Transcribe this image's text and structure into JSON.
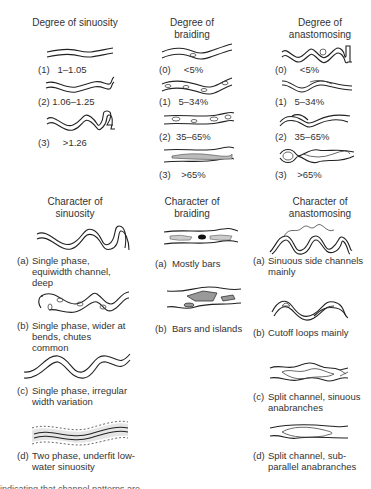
{
  "figure": {
    "type": "river channel pattern classification diagram",
    "panels": {
      "degree_sinuosity": {
        "heading": "Degree of sinuosity",
        "items": [
          {
            "key": "(1)",
            "value": "1–1.05"
          },
          {
            "key": "(2)",
            "value": "1.06–1.25"
          },
          {
            "key": "(3)",
            "value": ">1.26"
          }
        ]
      },
      "degree_braiding": {
        "heading": "Degree of braiding",
        "items": [
          {
            "key": "(0)",
            "value": "<5%"
          },
          {
            "key": "(1)",
            "value": "5–34%"
          },
          {
            "key": "(2)",
            "value": "35–65%"
          },
          {
            "key": "(3)",
            "value": ">65%"
          }
        ]
      },
      "degree_anastomosing": {
        "heading": "Degree of anastomosing",
        "items": [
          {
            "key": "(0)",
            "value": "<5%"
          },
          {
            "key": "(1)",
            "value": "5–34%"
          },
          {
            "key": "(2)",
            "value": "35–65%"
          },
          {
            "key": "(3)",
            "value": ">65%"
          }
        ]
      },
      "character_sinuosity": {
        "heading": "Character of sinuosity",
        "items": [
          {
            "key": "(a)",
            "value": "Single phase, equiwidth channel, deep"
          },
          {
            "key": "(b)",
            "value": "Single phase, wider at bends, chutes common"
          },
          {
            "key": "(c)",
            "value": "Single phase, irregular width variation"
          },
          {
            "key": "(d)",
            "value": "Two phase, underfit low-water sinuosity"
          }
        ]
      },
      "character_braiding": {
        "heading": "Character of braiding",
        "items": [
          {
            "key": "(a)",
            "value": "Mostly bars"
          },
          {
            "key": "(b)",
            "value": "Bars and islands"
          }
        ]
      },
      "character_anastomosing": {
        "heading": "Character of anastomosing",
        "items": [
          {
            "key": "(a)",
            "value": "Sinuous side channels mainly"
          },
          {
            "key": "(b)",
            "value": "Cutoff loops mainly"
          },
          {
            "key": "(c)",
            "value": "Split channel, sinuous anabranches"
          },
          {
            "key": "(d)",
            "value": "Split channel, sub-parallel anabranches"
          }
        ]
      }
    },
    "footer_cut_text": "indicating that channel patterns are ..."
  }
}
